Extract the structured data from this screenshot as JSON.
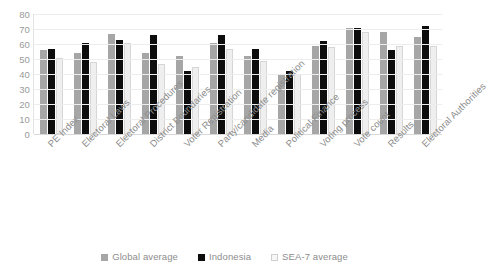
{
  "chart_data": {
    "type": "bar",
    "title": "",
    "xlabel": "",
    "ylabel": "",
    "ylim": [
      0,
      80
    ],
    "yticks": [
      "80",
      "70",
      "60",
      "50",
      "40",
      "30",
      "20",
      "10",
      "0"
    ],
    "grid": true,
    "legend_position": "bottom",
    "categories": [
      "PE Index",
      "Electoral Laws",
      "Electoral Procedures",
      "District Boundaries",
      "Voter Registration",
      "Party/candidate registration",
      "Media",
      "Political Finance",
      "Voting process",
      "Vote count",
      "Results",
      "Electoral Authorities"
    ],
    "series": [
      {
        "name": "Global average",
        "color": "#a6a6a6",
        "values": [
          56,
          54,
          67,
          54,
          52,
          61,
          52,
          40,
          59,
          71,
          68,
          65
        ]
      },
      {
        "name": "Indonesia",
        "color": "#0d0d0d",
        "values": [
          57,
          61,
          63,
          66,
          42,
          66,
          57,
          42,
          62,
          71,
          56,
          72
        ]
      },
      {
        "name": "SEA-7 average",
        "color": "#efefef",
        "values": [
          51,
          48,
          61,
          47,
          45,
          57,
          49,
          40,
          58,
          68,
          59,
          59
        ]
      }
    ]
  },
  "legend": {
    "items": [
      {
        "label": "Global average"
      },
      {
        "label": "Indonesia"
      },
      {
        "label": "SEA-7 average"
      }
    ]
  }
}
